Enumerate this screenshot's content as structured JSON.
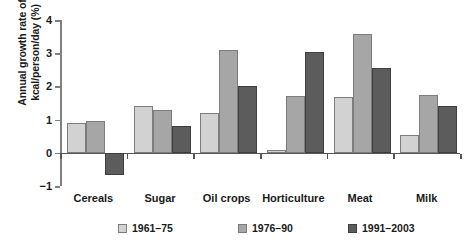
{
  "chart_data": {
    "type": "bar",
    "title": "",
    "xlabel": "",
    "ylabel": "Annual growth rate of kcal/person/day (%)",
    "ylabel_lines": [
      "Annual growth rate of",
      "kcal/person/day (%)"
    ],
    "categories": [
      "Cereals",
      "Sugar",
      "Oil crops",
      "Horticulture",
      "Meat",
      "Milk"
    ],
    "series": [
      {
        "name": "1961–75",
        "color": "#d2d2d2",
        "values": [
          0.9,
          1.4,
          1.2,
          0.08,
          1.67,
          0.55
        ]
      },
      {
        "name": "1976–90",
        "color": "#a6a6a6",
        "values": [
          0.97,
          1.28,
          3.1,
          1.72,
          3.58,
          1.75
        ]
      },
      {
        "name": "1991–2003",
        "color": "#5c5c5c",
        "values": [
          -0.67,
          0.8,
          2.0,
          3.03,
          2.55,
          1.42
        ]
      }
    ],
    "ylim": [
      -1,
      4
    ],
    "yticks": [
      -1,
      0,
      1,
      2,
      3,
      4
    ],
    "ytick_labels": [
      "−1",
      "0",
      "1",
      "2",
      "3",
      "4"
    ],
    "grid": false,
    "legend_position": "bottom"
  }
}
